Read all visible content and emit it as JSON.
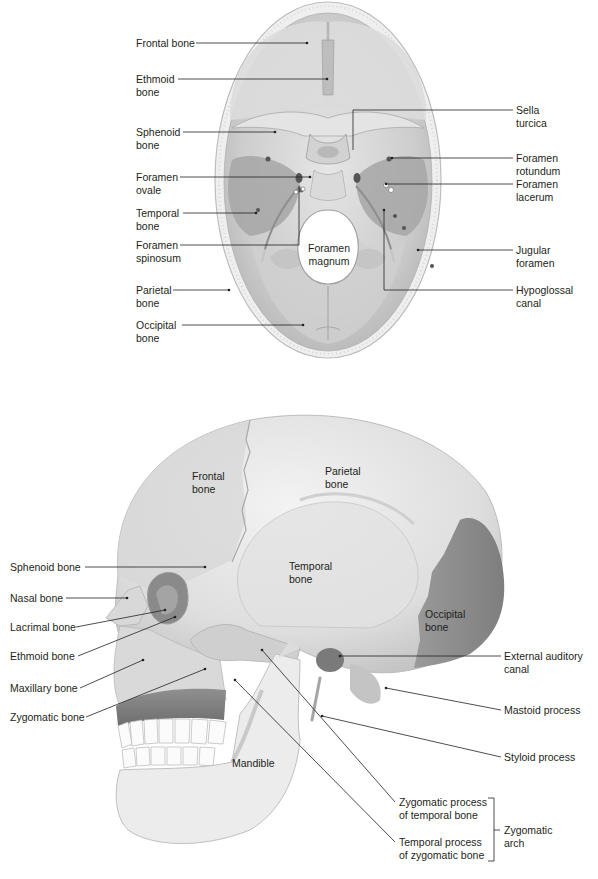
{
  "figure": {
    "top_view": {
      "title": "Superior view of cranial floor",
      "left_labels": [
        {
          "id": "frontal-bone",
          "text": "Frontal bone"
        },
        {
          "id": "ethmoid-bone",
          "text": "Ethmoid\nbone"
        },
        {
          "id": "sphenoid-bone",
          "text": "Sphenoid\nbone"
        },
        {
          "id": "foramen-ovale",
          "text": "Foramen\novale"
        },
        {
          "id": "temporal-bone",
          "text": "Temporal\nbone"
        },
        {
          "id": "foramen-spinosum",
          "text": "Foramen\nspinosum"
        },
        {
          "id": "parietal-bone",
          "text": "Parietal\nbone"
        },
        {
          "id": "occipital-bone",
          "text": "Occipital\nbone"
        }
      ],
      "right_labels": [
        {
          "id": "sella-turcica",
          "text": "Sella\nturcica"
        },
        {
          "id": "foramen-rotundum",
          "text": "Foramen\nrotundum"
        },
        {
          "id": "foramen-lacerum",
          "text": "Foramen\nlacerum"
        },
        {
          "id": "jugular-foramen",
          "text": "Jugular\nforamen"
        },
        {
          "id": "hypoglossal-canal",
          "text": "Hypoglossal\ncanal"
        }
      ],
      "inner_labels": [
        {
          "id": "foramen-magnum",
          "text": "Foramen\nmagnum"
        }
      ]
    },
    "lateral_view": {
      "title": "Lateral view of skull",
      "left_labels": [
        {
          "id": "sphenoid-bone",
          "text": "Sphenoid bone"
        },
        {
          "id": "nasal-bone",
          "text": "Nasal bone"
        },
        {
          "id": "lacrimal-bone",
          "text": "Lacrimal bone"
        },
        {
          "id": "ethmoid-bone",
          "text": "Ethmoid bone"
        },
        {
          "id": "maxillary-bone",
          "text": "Maxillary bone"
        },
        {
          "id": "zygomatic-bone",
          "text": "Zygomatic bone"
        }
      ],
      "right_labels": [
        {
          "id": "external-auditory-canal",
          "text": "External auditory\ncanal"
        },
        {
          "id": "mastoid-process",
          "text": "Mastoid process"
        },
        {
          "id": "styloid-process",
          "text": "Styloid process"
        },
        {
          "id": "zygomatic-process-temporal",
          "text": "Zygomatic process\nof temporal bone"
        },
        {
          "id": "temporal-process-zygomatic",
          "text": "Temporal process\nof zygomatic bone"
        }
      ],
      "bracket_label": {
        "id": "zygomatic-arch",
        "text": "Zygomatic\narch"
      },
      "inner_labels": [
        {
          "id": "frontal-bone",
          "text": "Frontal\nbone"
        },
        {
          "id": "parietal-bone",
          "text": "Parietal\nbone"
        },
        {
          "id": "temporal-bone",
          "text": "Temporal\nbone"
        },
        {
          "id": "occipital-bone",
          "text": "Occipital\nbone"
        },
        {
          "id": "mandible",
          "text": "Mandible"
        }
      ]
    },
    "colors": {
      "bone_light": "#e9e9e9",
      "bone_mid": "#cfcfcf",
      "bone_dark": "#a8a8a8",
      "temporal_fossa": "#9c9c9c",
      "occipital_highlight": "#8f8f8f",
      "leader_line": "#231f20",
      "text": "#231f20"
    }
  }
}
